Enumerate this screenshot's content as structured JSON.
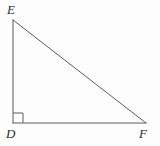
{
  "figure": {
    "type": "right-triangle-diagram",
    "background_color": "#fdfdfd",
    "stroke_color": "#5c5c5c",
    "label_color": "#2b2b2b",
    "stroke_width": 1,
    "width": 160,
    "height": 146,
    "vertices": [
      {
        "name": "E",
        "label": "E",
        "x": 13,
        "y": 20,
        "role": "apex-top-left"
      },
      {
        "name": "D",
        "label": "D",
        "x": 13,
        "y": 123,
        "role": "right-angle-vertex-bottom-left"
      },
      {
        "name": "F",
        "label": "F",
        "x": 146,
        "y": 123,
        "role": "vertex-bottom-right"
      }
    ],
    "edges": [
      {
        "name": "leg-ED",
        "from": "E",
        "to": "D",
        "orientation": "vertical"
      },
      {
        "name": "leg-DF",
        "from": "D",
        "to": "F",
        "orientation": "horizontal"
      },
      {
        "name": "hypotenuse-EF",
        "from": "E",
        "to": "F",
        "orientation": "diagonal"
      }
    ],
    "right_angle_marker": {
      "at_vertex": "D",
      "x": 13,
      "y": 113,
      "size": 10
    },
    "labels": {
      "E": "E",
      "D": "D",
      "F": "F"
    }
  }
}
